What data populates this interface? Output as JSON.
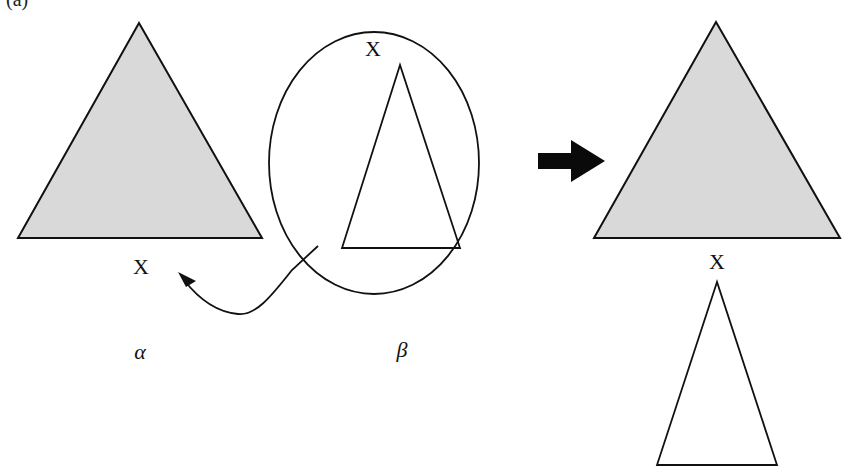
{
  "figure": {
    "panel_label": "(a)",
    "colors": {
      "background": "#ffffff",
      "shaded_fill": "#d9d9d9",
      "stroke": "#111111",
      "arrow": "#0a0a0a"
    },
    "left_tree": {
      "shape": "shaded-triangle",
      "foot_label": "X",
      "caption": "α"
    },
    "auxiliary_tree": {
      "shape": "circled-unshaded-triangle",
      "root_label": "X",
      "caption": "β"
    },
    "operation_arrow": "block-arrow-right",
    "result_tree": {
      "upper_shape": "shaded-triangle",
      "junction_label": "X",
      "lower_shape": "unshaded-triangle"
    }
  }
}
